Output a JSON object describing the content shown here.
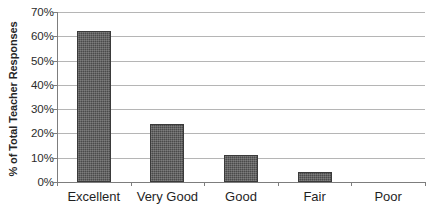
{
  "chart_data": {
    "type": "bar",
    "title": "",
    "subtitle": "",
    "xlabel": "",
    "ylabel": "% of Total Teacher Responses",
    "categories": [
      "Excellent",
      "Very Good",
      "Good",
      "Fair",
      "Poor"
    ],
    "values": [
      62,
      24,
      11,
      4,
      0
    ],
    "series": [
      {
        "name": "% of Total Teacher Responses",
        "values": [
          62,
          24,
          11,
          4,
          0
        ]
      }
    ],
    "ylim": [
      0,
      70
    ],
    "ytick_values": [
      0,
      10,
      20,
      30,
      40,
      50,
      60,
      70
    ],
    "ytick_labels": [
      "0%",
      "10%",
      "20%",
      "30%",
      "40%",
      "50%",
      "60%",
      "70%"
    ],
    "grid": true,
    "grid_axis": "y",
    "legend": false,
    "legend_position": "none",
    "bar_color": "#4a4a4a",
    "bar_pattern": "dithered-checker",
    "gridline_color": "#b5b5b5",
    "axis_color": "#7d7d7d",
    "background_color": "#ffffff",
    "annotations": []
  }
}
